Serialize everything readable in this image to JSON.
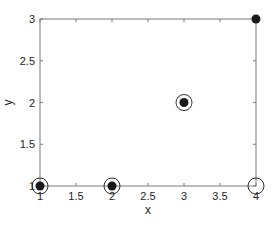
{
  "chart_data": {
    "type": "scatter",
    "title": "",
    "xlabel": "x",
    "ylabel": "y",
    "xlim": [
      1,
      4
    ],
    "ylim": [
      1,
      3
    ],
    "xticks": [
      "1",
      "1.5",
      "2",
      "2.5",
      "3",
      "3.5",
      "4"
    ],
    "yticks": [
      "1",
      "1.5",
      "2",
      "2.5",
      "3"
    ],
    "grid": false,
    "series": [
      {
        "name": "filled",
        "marker": "filled-dot",
        "color": "#1a1a1a",
        "points": [
          [
            1,
            1
          ],
          [
            2,
            1
          ],
          [
            3,
            2
          ],
          [
            4,
            3
          ]
        ]
      },
      {
        "name": "open",
        "marker": "open-circle",
        "color": "#1a1a1a",
        "points": [
          [
            1,
            1
          ],
          [
            2,
            1
          ],
          [
            3,
            2
          ],
          [
            4,
            1
          ]
        ]
      }
    ]
  }
}
